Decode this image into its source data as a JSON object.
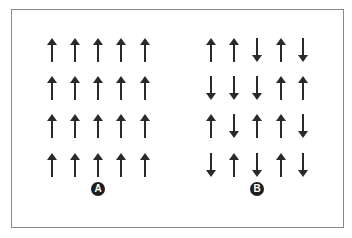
{
  "diagram": {
    "type": "spin-orientation-comparison",
    "arrow_color": "#2a2a2a",
    "label_bg": "#1e1e1e",
    "panels": [
      {
        "label": "A",
        "rows": [
          [
            "up",
            "up",
            "up",
            "up",
            "up"
          ],
          [
            "up",
            "up",
            "up",
            "up",
            "up"
          ],
          [
            "up",
            "up",
            "up",
            "up",
            "up"
          ],
          [
            "up",
            "up",
            "up",
            "up",
            "up"
          ]
        ]
      },
      {
        "label": "B",
        "rows": [
          [
            "up",
            "up",
            "down",
            "up",
            "down"
          ],
          [
            "down",
            "down",
            "down",
            "up",
            "up"
          ],
          [
            "up",
            "down",
            "up",
            "up",
            "down"
          ],
          [
            "down",
            "up",
            "down",
            "up",
            "down"
          ]
        ]
      }
    ]
  }
}
